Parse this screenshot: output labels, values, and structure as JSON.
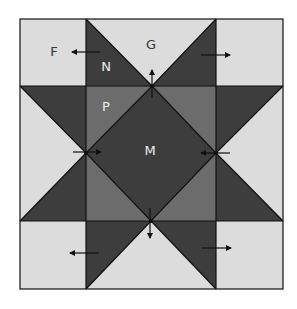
{
  "diagram": {
    "colors": {
      "light": "#dcdcdc",
      "dark": "#3d3d3d",
      "medium": "#6c6c6c",
      "line": "#111111",
      "label_dark": "#333333",
      "label_light": "#ededed",
      "background": "#ffffff"
    },
    "labels": {
      "F": "F",
      "G": "G",
      "N": "N",
      "P": "P",
      "M": "M"
    },
    "arrows": [
      {
        "id": "corner-top-left",
        "direction": "left"
      },
      {
        "id": "corner-top-right",
        "direction": "right"
      },
      {
        "id": "corner-bottom-left",
        "direction": "left"
      },
      {
        "id": "corner-bottom-right",
        "direction": "right"
      },
      {
        "id": "center-top",
        "direction": "up"
      },
      {
        "id": "center-left",
        "direction": "right"
      },
      {
        "id": "center-right",
        "direction": "left"
      },
      {
        "id": "center-bottom",
        "direction": "down"
      }
    ]
  }
}
